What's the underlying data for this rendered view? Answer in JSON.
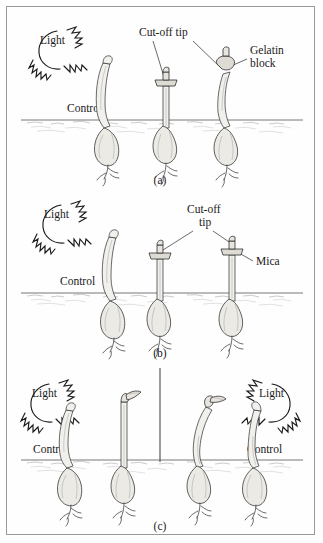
{
  "figure": {
    "background_color": "#fefefe",
    "border_color": "#9a9a9a",
    "ink_color": "#1a1a1a"
  },
  "panels": [
    {
      "id": "a",
      "caption": "(a)",
      "labels": {
        "light": "Light",
        "control": "Control",
        "cut_off_tip": "Cut-off tip",
        "gelatin_block_line1": "Gelatin",
        "gelatin_block_line2": "block"
      },
      "plants": [
        {
          "name": "control-seedling",
          "posture": "curved-toward-light",
          "tip": "intact"
        },
        {
          "name": "decapitated-seedling",
          "posture": "straight",
          "tip": "cut-off-tip-replaced"
        },
        {
          "name": "gelatin-block-seedling",
          "posture": "curved-toward-light",
          "tip": "cut-off-tip-on-gelatin-block"
        }
      ]
    },
    {
      "id": "b",
      "caption": "(b)",
      "labels": {
        "light": "Light",
        "control": "Control",
        "cut_off_tip_line1": "Cut-off",
        "cut_off_tip_line2": "tip",
        "mica": "Mica"
      },
      "plants": [
        {
          "name": "control-seedling",
          "posture": "curved-toward-light",
          "tip": "intact"
        },
        {
          "name": "mica-seedling-left",
          "posture": "straight",
          "tip": "cut-off-tip-on-mica"
        },
        {
          "name": "mica-seedling-right",
          "posture": "straight",
          "tip": "cut-off-tip-on-mica"
        }
      ]
    },
    {
      "id": "c",
      "caption": "(c)",
      "labels": {
        "light_left": "Light",
        "light_right": "Light",
        "control_left": "Control",
        "control_right": "Control"
      },
      "plants": [
        {
          "name": "control-seedling-left",
          "posture": "curved-toward-left-light",
          "tip": "intact"
        },
        {
          "name": "shaded-seedling-left",
          "posture": "straight",
          "tip": "flag-tip"
        },
        {
          "name": "shaded-seedling-right",
          "posture": "curved-right",
          "tip": "flag-tip"
        },
        {
          "name": "control-seedling-right",
          "posture": "curved-toward-right-light",
          "tip": "intact"
        }
      ],
      "divider": {
        "name": "light-barrier",
        "orientation": "vertical"
      }
    }
  ]
}
